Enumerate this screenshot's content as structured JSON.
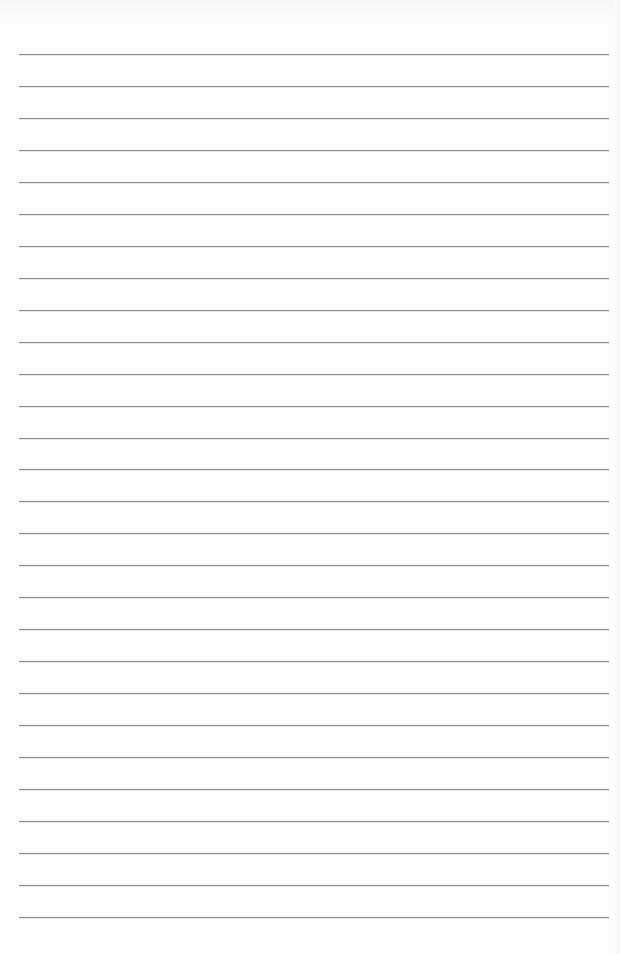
{
  "document": {
    "type": "lined-paper",
    "background_color": "#fdfdfd",
    "line_color": "#8a8a8a",
    "line_count": 28,
    "first_line_y": 54,
    "line_spacing": 31.96,
    "line_left": 19,
    "line_right": 609,
    "lines": [
      {
        "text": ""
      },
      {
        "text": ""
      },
      {
        "text": ""
      },
      {
        "text": ""
      },
      {
        "text": ""
      },
      {
        "text": ""
      },
      {
        "text": ""
      },
      {
        "text": ""
      },
      {
        "text": ""
      },
      {
        "text": ""
      },
      {
        "text": ""
      },
      {
        "text": ""
      },
      {
        "text": ""
      },
      {
        "text": ""
      },
      {
        "text": ""
      },
      {
        "text": ""
      },
      {
        "text": ""
      },
      {
        "text": ""
      },
      {
        "text": ""
      },
      {
        "text": ""
      },
      {
        "text": ""
      },
      {
        "text": ""
      },
      {
        "text": ""
      },
      {
        "text": ""
      },
      {
        "text": ""
      },
      {
        "text": ""
      },
      {
        "text": ""
      },
      {
        "text": ""
      }
    ]
  }
}
